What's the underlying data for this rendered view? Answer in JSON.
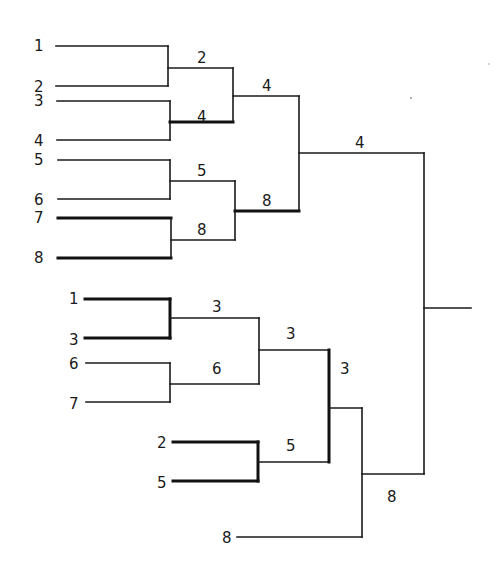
{
  "diagram": {
    "type": "tournament-bracket",
    "line_color": "#1a1a1a",
    "top_bracket": {
      "round1": [
        {
          "pair": [
            "1",
            "2"
          ],
          "winner": "2"
        },
        {
          "pair": [
            "3",
            "4"
          ],
          "winner": "4"
        },
        {
          "pair": [
            "5",
            "6"
          ],
          "winner": "5"
        },
        {
          "pair": [
            "7",
            "8"
          ],
          "winner": "8"
        }
      ],
      "round2": [
        {
          "pair": [
            "2",
            "4"
          ],
          "winner": "4"
        },
        {
          "pair": [
            "5",
            "8"
          ],
          "winner": "8"
        }
      ],
      "round3": [
        {
          "pair": [
            "4",
            "8"
          ],
          "winner": "4"
        }
      ]
    },
    "bottom_bracket": {
      "round1": [
        {
          "pair": [
            "1",
            "3"
          ],
          "winner": "3"
        },
        {
          "pair": [
            "6",
            "7"
          ],
          "winner": "6"
        },
        {
          "pair": [
            "2",
            "5"
          ],
          "winner": "5"
        }
      ],
      "round2": [
        {
          "pair": [
            "3",
            "6"
          ],
          "winner": "3"
        }
      ],
      "round3": [
        {
          "pair": [
            "3",
            "5"
          ],
          "winner": "3"
        }
      ],
      "round4": [
        {
          "pair": [
            "3",
            "8"
          ],
          "winner": "8"
        }
      ]
    },
    "final": {
      "pair": [
        "4",
        "8"
      ]
    }
  },
  "labels": {
    "top": {
      "entrants": [
        "1",
        "2",
        "3",
        "4",
        "5",
        "6",
        "7",
        "8"
      ],
      "r2": [
        "2",
        "4",
        "5",
        "8"
      ],
      "r3": [
        "4",
        "8"
      ],
      "r4": "4"
    },
    "bottom": {
      "entrants": [
        "1",
        "3",
        "6",
        "7",
        "2",
        "5",
        "8"
      ],
      "r2": [
        "3",
        "6",
        "5"
      ],
      "r3": "3",
      "r4": "3",
      "r5": "8"
    }
  },
  "geometry": {
    "lines": [
      {
        "id": "t-e1",
        "x1": 56,
        "y1": 46,
        "x2": 168,
        "y2": 46,
        "bold": false
      },
      {
        "id": "t-e2",
        "x1": 56,
        "y1": 86,
        "x2": 168,
        "y2": 86,
        "bold": false
      },
      {
        "id": "t-v12",
        "x1": 168,
        "y1": 46,
        "x2": 168,
        "y2": 86,
        "bold": false
      },
      {
        "id": "t-e3",
        "x1": 57,
        "y1": 101,
        "x2": 170,
        "y2": 101,
        "bold": false
      },
      {
        "id": "t-e4",
        "x1": 57,
        "y1": 140,
        "x2": 170,
        "y2": 140,
        "bold": false
      },
      {
        "id": "t-v34",
        "x1": 170,
        "y1": 101,
        "x2": 170,
        "y2": 140,
        "bold": false
      },
      {
        "id": "t-e5",
        "x1": 58,
        "y1": 160,
        "x2": 170,
        "y2": 160,
        "bold": false
      },
      {
        "id": "t-e6",
        "x1": 58,
        "y1": 199,
        "x2": 170,
        "y2": 199,
        "bold": false
      },
      {
        "id": "t-v56",
        "x1": 170,
        "y1": 160,
        "x2": 170,
        "y2": 199,
        "bold": false
      },
      {
        "id": "t-e7",
        "x1": 58,
        "y1": 218,
        "x2": 171,
        "y2": 218,
        "bold": true
      },
      {
        "id": "t-e8",
        "x1": 58,
        "y1": 258,
        "x2": 171,
        "y2": 258,
        "bold": true
      },
      {
        "id": "t-v78",
        "x1": 171,
        "y1": 218,
        "x2": 171,
        "y2": 258,
        "bold": false
      },
      {
        "id": "t-r2a",
        "x1": 168,
        "y1": 68,
        "x2": 233,
        "y2": 68,
        "bold": false
      },
      {
        "id": "t-r2b",
        "x1": 170,
        "y1": 122,
        "x2": 233,
        "y2": 122,
        "bold": true
      },
      {
        "id": "t-v2ab",
        "x1": 233,
        "y1": 68,
        "x2": 233,
        "y2": 122,
        "bold": false
      },
      {
        "id": "t-r2c",
        "x1": 170,
        "y1": 181,
        "x2": 235,
        "y2": 181,
        "bold": false
      },
      {
        "id": "t-r2d",
        "x1": 171,
        "y1": 240,
        "x2": 235,
        "y2": 240,
        "bold": false
      },
      {
        "id": "t-v2cd",
        "x1": 235,
        "y1": 181,
        "x2": 235,
        "y2": 240,
        "bold": false
      },
      {
        "id": "t-r3a",
        "x1": 233,
        "y1": 96,
        "x2": 299,
        "y2": 96,
        "bold": false
      },
      {
        "id": "t-r3b",
        "x1": 235,
        "y1": 211,
        "x2": 299,
        "y2": 211,
        "bold": true
      },
      {
        "id": "t-v3",
        "x1": 299,
        "y1": 96,
        "x2": 299,
        "y2": 211,
        "bold": false
      },
      {
        "id": "t-r4",
        "x1": 299,
        "y1": 153,
        "x2": 424,
        "y2": 153,
        "bold": false
      },
      {
        "id": "b-e1",
        "x1": 85,
        "y1": 299,
        "x2": 170,
        "y2": 299,
        "bold": true
      },
      {
        "id": "b-e3",
        "x1": 85,
        "y1": 338,
        "x2": 170,
        "y2": 338,
        "bold": true
      },
      {
        "id": "b-v13",
        "x1": 170,
        "y1": 299,
        "x2": 170,
        "y2": 338,
        "bold": true
      },
      {
        "id": "b-e6",
        "x1": 86,
        "y1": 363,
        "x2": 170,
        "y2": 363,
        "bold": false
      },
      {
        "id": "b-e7",
        "x1": 86,
        "y1": 402,
        "x2": 170,
        "y2": 402,
        "bold": false
      },
      {
        "id": "b-v67",
        "x1": 170,
        "y1": 363,
        "x2": 170,
        "y2": 402,
        "bold": false
      },
      {
        "id": "b-r2a",
        "x1": 170,
        "y1": 318,
        "x2": 259,
        "y2": 318,
        "bold": false
      },
      {
        "id": "b-r2b",
        "x1": 170,
        "y1": 384,
        "x2": 259,
        "y2": 384,
        "bold": false
      },
      {
        "id": "b-v2ab",
        "x1": 259,
        "y1": 318,
        "x2": 259,
        "y2": 384,
        "bold": false
      },
      {
        "id": "b-e2",
        "x1": 173,
        "y1": 442,
        "x2": 258,
        "y2": 442,
        "bold": true
      },
      {
        "id": "b-e5",
        "x1": 173,
        "y1": 481,
        "x2": 258,
        "y2": 481,
        "bold": true
      },
      {
        "id": "b-v25",
        "x1": 258,
        "y1": 442,
        "x2": 258,
        "y2": 481,
        "bold": true
      },
      {
        "id": "b-r3a",
        "x1": 259,
        "y1": 350,
        "x2": 329,
        "y2": 350,
        "bold": false
      },
      {
        "id": "b-r3b",
        "x1": 258,
        "y1": 462,
        "x2": 329,
        "y2": 462,
        "bold": false
      },
      {
        "id": "b-v3",
        "x1": 329,
        "y1": 350,
        "x2": 329,
        "y2": 462,
        "bold": true
      },
      {
        "id": "b-r4",
        "x1": 329,
        "y1": 408,
        "x2": 362,
        "y2": 408,
        "bold": false
      },
      {
        "id": "b-e8",
        "x1": 237,
        "y1": 537,
        "x2": 362,
        "y2": 537,
        "bold": false
      },
      {
        "id": "b-v4",
        "x1": 362,
        "y1": 408,
        "x2": 362,
        "y2": 537,
        "bold": false
      },
      {
        "id": "b-r5",
        "x1": 362,
        "y1": 474,
        "x2": 424,
        "y2": 474,
        "bold": false
      },
      {
        "id": "f-v",
        "x1": 424,
        "y1": 153,
        "x2": 424,
        "y2": 474,
        "bold": false
      },
      {
        "id": "f-out",
        "x1": 424,
        "y1": 308,
        "x2": 471,
        "y2": 308,
        "bold": false
      }
    ],
    "texts": [
      {
        "id": "t-l1",
        "x": 34,
        "y": 51,
        "text": "1"
      },
      {
        "id": "t-l2",
        "x": 34,
        "y": 92,
        "text": "2"
      },
      {
        "id": "t-l3",
        "x": 34,
        "y": 106,
        "text": "3"
      },
      {
        "id": "t-l4",
        "x": 34,
        "y": 146,
        "text": "4"
      },
      {
        "id": "t-l5",
        "x": 34,
        "y": 165,
        "text": "5"
      },
      {
        "id": "t-l6",
        "x": 34,
        "y": 205,
        "text": "6"
      },
      {
        "id": "t-l7",
        "x": 34,
        "y": 223,
        "text": "7"
      },
      {
        "id": "t-l8",
        "x": 34,
        "y": 263,
        "text": "8"
      },
      {
        "id": "t-w2",
        "x": 197,
        "y": 63,
        "text": "2"
      },
      {
        "id": "t-w4a",
        "x": 197,
        "y": 122,
        "text": "4"
      },
      {
        "id": "t-w5",
        "x": 197,
        "y": 176,
        "text": "5"
      },
      {
        "id": "t-w8a",
        "x": 197,
        "y": 235,
        "text": "8"
      },
      {
        "id": "t-w4b",
        "x": 262,
        "y": 91,
        "text": "4"
      },
      {
        "id": "t-w8b",
        "x": 262,
        "y": 206,
        "text": "8"
      },
      {
        "id": "t-w4c",
        "x": 355,
        "y": 148,
        "text": "4"
      },
      {
        "id": "b-l1",
        "x": 69,
        "y": 304,
        "text": "1"
      },
      {
        "id": "b-l3",
        "x": 69,
        "y": 345,
        "text": "3"
      },
      {
        "id": "b-l6",
        "x": 69,
        "y": 369,
        "text": "6"
      },
      {
        "id": "b-l7",
        "x": 69,
        "y": 409,
        "text": "7"
      },
      {
        "id": "b-l2",
        "x": 157,
        "y": 448,
        "text": "2"
      },
      {
        "id": "b-l5",
        "x": 157,
        "y": 488,
        "text": "5"
      },
      {
        "id": "b-l8",
        "x": 222,
        "y": 543,
        "text": "8"
      },
      {
        "id": "b-w3a",
        "x": 212,
        "y": 312,
        "text": "3"
      },
      {
        "id": "b-w6",
        "x": 212,
        "y": 374,
        "text": "6"
      },
      {
        "id": "b-w5",
        "x": 286,
        "y": 451,
        "text": "5"
      },
      {
        "id": "b-w3b",
        "x": 286,
        "y": 339,
        "text": "3"
      },
      {
        "id": "b-w3c",
        "x": 340,
        "y": 374,
        "text": "3"
      },
      {
        "id": "b-w8",
        "x": 387,
        "y": 502,
        "text": "8"
      }
    ]
  }
}
